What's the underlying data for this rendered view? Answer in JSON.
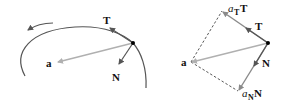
{
  "figure": {
    "left_panel": {
      "labels": {
        "tangent": "T",
        "normal": "N",
        "acceleration": "a"
      }
    },
    "right_panel": {
      "labels": {
        "tangent": "T",
        "normal": "N",
        "acceleration": "a",
        "tangential_component_coef": "a",
        "tangential_component_sub": "T",
        "tangential_component_vec": "T",
        "normal_component_coef": "a",
        "normal_component_sub": "N",
        "normal_component_vec": "N"
      }
    },
    "colors": {
      "curve": "#555555",
      "acceleration_vector": "#b0b0b0",
      "unit_vectors": "#555555",
      "component_vectors": "#8a8a8a",
      "dashed_lines": "#444444",
      "point": "#000000",
      "text": "#111111"
    }
  }
}
